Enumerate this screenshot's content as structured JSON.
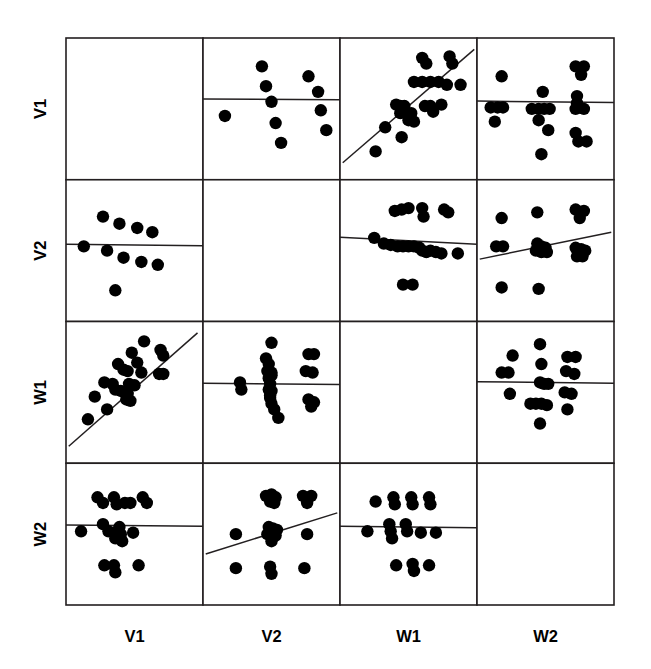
{
  "chart_data": {
    "type": "scatter",
    "title": "",
    "subtitle": "",
    "xlabel": "",
    "ylabel": "",
    "layout": "scatterplot-matrix",
    "grid": false,
    "legend": "none",
    "matrix_size": 4,
    "variables": [
      "V1",
      "V2",
      "W1",
      "W2"
    ],
    "row_labels": [
      "V1",
      "V2",
      "W1",
      "W2"
    ],
    "column_labels": [
      "V1",
      "V2",
      "W1",
      "W2"
    ],
    "row_label_rotation_deg": -90,
    "diagonal_panels_empty": true,
    "axis_ranges": {
      "V1": [
        0,
        1
      ],
      "V2": [
        0,
        1
      ],
      "W1": [
        0,
        1
      ],
      "W2": [
        0,
        1
      ]
    },
    "panels": [
      {
        "row": "V1",
        "col": "V1",
        "empty": true,
        "points": [],
        "fit_line": null
      },
      {
        "row": "V1",
        "col": "V2",
        "empty": false,
        "fit_line": {
          "x0": 0.0,
          "y0": 0.57,
          "x1": 1.0,
          "y1": 0.565
        },
        "points": [
          [
            0.43,
            0.8
          ],
          [
            0.77,
            0.73
          ],
          [
            0.46,
            0.66
          ],
          [
            0.84,
            0.62
          ],
          [
            0.5,
            0.55
          ],
          [
            0.16,
            0.45
          ],
          [
            0.86,
            0.49
          ],
          [
            0.53,
            0.4
          ],
          [
            0.9,
            0.35
          ],
          [
            0.57,
            0.26
          ]
        ]
      },
      {
        "row": "V1",
        "col": "W1",
        "empty": false,
        "fit_line": {
          "x0": 0.02,
          "y0": 0.12,
          "x1": 0.98,
          "y1": 0.92
        },
        "points": [
          [
            0.6,
            0.86
          ],
          [
            0.63,
            0.82
          ],
          [
            0.8,
            0.87
          ],
          [
            0.82,
            0.82
          ],
          [
            0.54,
            0.69
          ],
          [
            0.6,
            0.69
          ],
          [
            0.66,
            0.69
          ],
          [
            0.72,
            0.69
          ],
          [
            0.78,
            0.67
          ],
          [
            0.88,
            0.67
          ],
          [
            0.41,
            0.53
          ],
          [
            0.44,
            0.52
          ],
          [
            0.47,
            0.52
          ],
          [
            0.44,
            0.47
          ],
          [
            0.48,
            0.47
          ],
          [
            0.52,
            0.47
          ],
          [
            0.62,
            0.52
          ],
          [
            0.66,
            0.52
          ],
          [
            0.68,
            0.48
          ],
          [
            0.74,
            0.53
          ],
          [
            0.5,
            0.42
          ],
          [
            0.54,
            0.41
          ],
          [
            0.33,
            0.37
          ],
          [
            0.45,
            0.3
          ],
          [
            0.26,
            0.2
          ]
        ]
      },
      {
        "row": "V1",
        "col": "W2",
        "empty": false,
        "fit_line": {
          "x0": 0.0,
          "y0": 0.555,
          "x1": 1.0,
          "y1": 0.545
        },
        "points": [
          [
            0.18,
            0.73
          ],
          [
            0.48,
            0.62
          ],
          [
            0.72,
            0.8
          ],
          [
            0.78,
            0.8
          ],
          [
            0.76,
            0.74
          ],
          [
            0.73,
            0.59
          ],
          [
            0.73,
            0.54
          ],
          [
            0.1,
            0.51
          ],
          [
            0.15,
            0.51
          ],
          [
            0.19,
            0.51
          ],
          [
            0.4,
            0.5
          ],
          [
            0.45,
            0.5
          ],
          [
            0.49,
            0.5
          ],
          [
            0.53,
            0.5
          ],
          [
            0.72,
            0.5
          ],
          [
            0.78,
            0.5
          ],
          [
            0.13,
            0.41
          ],
          [
            0.45,
            0.42
          ],
          [
            0.52,
            0.35
          ],
          [
            0.72,
            0.33
          ],
          [
            0.74,
            0.27
          ],
          [
            0.8,
            0.27
          ],
          [
            0.47,
            0.18
          ]
        ]
      },
      {
        "row": "V2",
        "col": "V1",
        "empty": false,
        "fit_line": {
          "x0": 0.0,
          "y0": 0.545,
          "x1": 1.0,
          "y1": 0.535
        },
        "points": [
          [
            0.27,
            0.74
          ],
          [
            0.39,
            0.69
          ],
          [
            0.52,
            0.66
          ],
          [
            0.63,
            0.63
          ],
          [
            0.13,
            0.53
          ],
          [
            0.3,
            0.5
          ],
          [
            0.42,
            0.45
          ],
          [
            0.55,
            0.42
          ],
          [
            0.67,
            0.4
          ],
          [
            0.36,
            0.22
          ]
        ]
      },
      {
        "row": "V2",
        "col": "V2",
        "empty": true,
        "points": [],
        "fit_line": null
      },
      {
        "row": "V2",
        "col": "W1",
        "empty": false,
        "fit_line": {
          "x0": 0.0,
          "y0": 0.595,
          "x1": 1.0,
          "y1": 0.545
        },
        "points": [
          [
            0.4,
            0.78
          ],
          [
            0.45,
            0.79
          ],
          [
            0.5,
            0.8
          ],
          [
            0.6,
            0.8
          ],
          [
            0.61,
            0.74
          ],
          [
            0.76,
            0.79
          ],
          [
            0.79,
            0.77
          ],
          [
            0.25,
            0.59
          ],
          [
            0.32,
            0.55
          ],
          [
            0.37,
            0.54
          ],
          [
            0.42,
            0.53
          ],
          [
            0.46,
            0.53
          ],
          [
            0.5,
            0.53
          ],
          [
            0.54,
            0.53
          ],
          [
            0.58,
            0.52
          ],
          [
            0.6,
            0.5
          ],
          [
            0.63,
            0.49
          ],
          [
            0.66,
            0.5
          ],
          [
            0.7,
            0.49
          ],
          [
            0.74,
            0.48
          ],
          [
            0.86,
            0.48
          ],
          [
            0.46,
            0.26
          ],
          [
            0.53,
            0.26
          ]
        ]
      },
      {
        "row": "V2",
        "col": "W2",
        "empty": false,
        "fit_line": {
          "x0": 0.02,
          "y0": 0.44,
          "x1": 0.98,
          "y1": 0.63
        },
        "points": [
          [
            0.18,
            0.73
          ],
          [
            0.44,
            0.77
          ],
          [
            0.72,
            0.79
          ],
          [
            0.78,
            0.78
          ],
          [
            0.75,
            0.73
          ],
          [
            0.14,
            0.53
          ],
          [
            0.19,
            0.53
          ],
          [
            0.44,
            0.55
          ],
          [
            0.47,
            0.53
          ],
          [
            0.5,
            0.52
          ],
          [
            0.43,
            0.5
          ],
          [
            0.47,
            0.49
          ],
          [
            0.51,
            0.49
          ],
          [
            0.72,
            0.52
          ],
          [
            0.76,
            0.51
          ],
          [
            0.79,
            0.5
          ],
          [
            0.73,
            0.46
          ],
          [
            0.77,
            0.46
          ],
          [
            0.18,
            0.24
          ],
          [
            0.45,
            0.23
          ]
        ]
      },
      {
        "row": "W1",
        "col": "V1",
        "empty": false,
        "fit_line": {
          "x0": 0.02,
          "y0": 0.12,
          "x1": 0.96,
          "y1": 0.92
        },
        "points": [
          [
            0.57,
            0.86
          ],
          [
            0.48,
            0.78
          ],
          [
            0.69,
            0.8
          ],
          [
            0.71,
            0.76
          ],
          [
            0.38,
            0.7
          ],
          [
            0.52,
            0.71
          ],
          [
            0.42,
            0.66
          ],
          [
            0.45,
            0.65
          ],
          [
            0.55,
            0.64
          ],
          [
            0.68,
            0.63
          ],
          [
            0.71,
            0.63
          ],
          [
            0.28,
            0.57
          ],
          [
            0.34,
            0.56
          ],
          [
            0.36,
            0.52
          ],
          [
            0.4,
            0.51
          ],
          [
            0.43,
            0.5
          ],
          [
            0.45,
            0.49
          ],
          [
            0.44,
            0.45
          ],
          [
            0.47,
            0.44
          ],
          [
            0.21,
            0.47
          ],
          [
            0.3,
            0.38
          ],
          [
            0.16,
            0.31
          ],
          [
            0.46,
            0.56
          ],
          [
            0.5,
            0.55
          ]
        ]
      },
      {
        "row": "W1",
        "col": "V2",
        "empty": false,
        "fit_line": {
          "x0": 0.0,
          "y0": 0.565,
          "x1": 1.0,
          "y1": 0.555
        },
        "points": [
          [
            0.5,
            0.85
          ],
          [
            0.46,
            0.74
          ],
          [
            0.48,
            0.7
          ],
          [
            0.77,
            0.77
          ],
          [
            0.81,
            0.77
          ],
          [
            0.47,
            0.65
          ],
          [
            0.5,
            0.64
          ],
          [
            0.75,
            0.65
          ],
          [
            0.8,
            0.64
          ],
          [
            0.48,
            0.6
          ],
          [
            0.49,
            0.56
          ],
          [
            0.48,
            0.52
          ],
          [
            0.5,
            0.51
          ],
          [
            0.27,
            0.57
          ],
          [
            0.28,
            0.52
          ],
          [
            0.49,
            0.46
          ],
          [
            0.5,
            0.42
          ],
          [
            0.52,
            0.38
          ],
          [
            0.55,
            0.32
          ],
          [
            0.77,
            0.45
          ],
          [
            0.81,
            0.43
          ],
          [
            0.79,
            0.4
          ],
          [
            0.5,
            0.62
          ],
          [
            0.49,
            0.48
          ]
        ]
      },
      {
        "row": "W1",
        "col": "W1",
        "empty": true,
        "points": [],
        "fit_line": null
      },
      {
        "row": "W1",
        "col": "W2",
        "empty": false,
        "fit_line": {
          "x0": 0.0,
          "y0": 0.575,
          "x1": 1.0,
          "y1": 0.565
        },
        "points": [
          [
            0.46,
            0.84
          ],
          [
            0.26,
            0.76
          ],
          [
            0.47,
            0.7
          ],
          [
            0.66,
            0.75
          ],
          [
            0.72,
            0.75
          ],
          [
            0.18,
            0.64
          ],
          [
            0.23,
            0.64
          ],
          [
            0.65,
            0.65
          ],
          [
            0.71,
            0.63
          ],
          [
            0.46,
            0.57
          ],
          [
            0.49,
            0.56
          ],
          [
            0.52,
            0.56
          ],
          [
            0.24,
            0.49
          ],
          [
            0.64,
            0.5
          ],
          [
            0.69,
            0.49
          ],
          [
            0.39,
            0.42
          ],
          [
            0.43,
            0.42
          ],
          [
            0.47,
            0.42
          ],
          [
            0.51,
            0.41
          ],
          [
            0.66,
            0.38
          ],
          [
            0.46,
            0.28
          ]
        ]
      },
      {
        "row": "W2",
        "col": "V1",
        "empty": false,
        "fit_line": {
          "x0": 0.0,
          "y0": 0.565,
          "x1": 1.0,
          "y1": 0.555
        },
        "points": [
          [
            0.23,
            0.76
          ],
          [
            0.27,
            0.72
          ],
          [
            0.35,
            0.76
          ],
          [
            0.37,
            0.71
          ],
          [
            0.43,
            0.72
          ],
          [
            0.47,
            0.72
          ],
          [
            0.56,
            0.76
          ],
          [
            0.59,
            0.72
          ],
          [
            0.11,
            0.52
          ],
          [
            0.27,
            0.57
          ],
          [
            0.31,
            0.52
          ],
          [
            0.35,
            0.51
          ],
          [
            0.36,
            0.47
          ],
          [
            0.39,
            0.55
          ],
          [
            0.4,
            0.5
          ],
          [
            0.41,
            0.45
          ],
          [
            0.49,
            0.51
          ],
          [
            0.28,
            0.28
          ],
          [
            0.35,
            0.28
          ],
          [
            0.36,
            0.23
          ],
          [
            0.53,
            0.28
          ]
        ]
      },
      {
        "row": "W2",
        "col": "V2",
        "empty": false,
        "fit_line": {
          "x0": 0.02,
          "y0": 0.36,
          "x1": 0.98,
          "y1": 0.65
        },
        "points": [
          [
            0.46,
            0.77
          ],
          [
            0.5,
            0.78
          ],
          [
            0.53,
            0.76
          ],
          [
            0.49,
            0.73
          ],
          [
            0.52,
            0.72
          ],
          [
            0.73,
            0.77
          ],
          [
            0.79,
            0.77
          ],
          [
            0.76,
            0.72
          ],
          [
            0.24,
            0.5
          ],
          [
            0.48,
            0.55
          ],
          [
            0.51,
            0.54
          ],
          [
            0.54,
            0.53
          ],
          [
            0.47,
            0.5
          ],
          [
            0.5,
            0.49
          ],
          [
            0.53,
            0.49
          ],
          [
            0.5,
            0.45
          ],
          [
            0.76,
            0.5
          ],
          [
            0.24,
            0.26
          ],
          [
            0.49,
            0.27
          ],
          [
            0.5,
            0.22
          ],
          [
            0.74,
            0.26
          ]
        ]
      },
      {
        "row": "W2",
        "col": "W1",
        "empty": false,
        "fit_line": {
          "x0": 0.0,
          "y0": 0.555,
          "x1": 1.0,
          "y1": 0.545
        },
        "points": [
          [
            0.26,
            0.73
          ],
          [
            0.39,
            0.76
          ],
          [
            0.4,
            0.71
          ],
          [
            0.52,
            0.76
          ],
          [
            0.53,
            0.71
          ],
          [
            0.65,
            0.76
          ],
          [
            0.66,
            0.71
          ],
          [
            0.2,
            0.52
          ],
          [
            0.36,
            0.57
          ],
          [
            0.37,
            0.52
          ],
          [
            0.38,
            0.47
          ],
          [
            0.48,
            0.57
          ],
          [
            0.49,
            0.52
          ],
          [
            0.59,
            0.51
          ],
          [
            0.7,
            0.51
          ],
          [
            0.41,
            0.28
          ],
          [
            0.53,
            0.29
          ],
          [
            0.54,
            0.24
          ],
          [
            0.65,
            0.28
          ]
        ]
      },
      {
        "row": "W2",
        "col": "W2",
        "empty": true,
        "points": [],
        "fit_line": null
      }
    ]
  },
  "style": {
    "point_color": "#000000",
    "line_color": "#231f20",
    "frame_color": "#231f20",
    "background": "#ffffff",
    "point_radius_px": 6.2
  }
}
